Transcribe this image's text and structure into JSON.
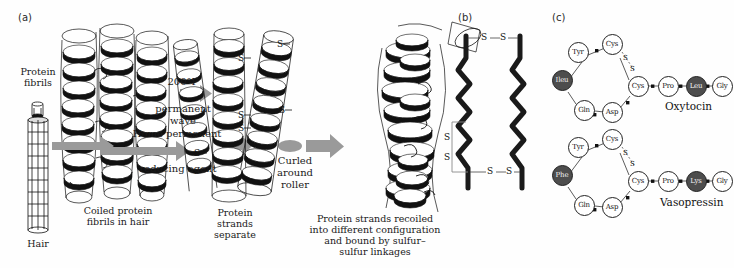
{
  "figure": {
    "background_color": "#fefefe",
    "ink_color": "#111111",
    "arrow_color": "#8c8c8c",
    "highlight_residue_color": "#4d4d4d"
  },
  "panels": {
    "a": {
      "label": "(a)",
      "labels": {
        "protein_fibrils": "Protein\nfibrils",
        "hair": "Hair"
      },
      "captions": {
        "coiled": "Coiled protein\nfibrils in hair",
        "separate": "Protein\nstrands\nseparate",
        "recoiled": "Protein strands recoiled\ninto different configuration\nand bound by sulfur–\nsulfur linkages"
      },
      "arrows": [
        {
          "name": "permanent-wave-arrow",
          "above": "200°F",
          "below": "permanent\nwave"
        },
        {
          "name": "home-permanent-arrow",
          "above": "Home permanent",
          "below": "reducing agent"
        },
        {
          "name": "curled-roller-arrow",
          "above": "",
          "below": "Curled\naround\nroller"
        }
      ],
      "sulfur_labels": [
        "S",
        "S",
        "S",
        "S",
        "S",
        "S"
      ]
    },
    "b": {
      "label": "(b)",
      "links": {
        "top": [
          "S",
          "S"
        ],
        "bottom": [
          "S",
          "S"
        ],
        "bracket": [
          "S",
          "S"
        ]
      }
    },
    "c": {
      "label": "(c)",
      "peptides": [
        {
          "name": "Oxytocin",
          "ring": [
            "Cys",
            "Tyr",
            "Ileu",
            "Gln",
            "Asp",
            "Cys"
          ],
          "ring_filled": [
            false,
            false,
            true,
            false,
            false,
            false
          ],
          "tail": [
            "Pro",
            "Leu",
            "Gly"
          ],
          "tail_filled": [
            false,
            true,
            false
          ],
          "disulfide": [
            "S",
            "S"
          ]
        },
        {
          "name": "Vasopressin",
          "ring": [
            "Cys",
            "Tyr",
            "Phe",
            "Gln",
            "Asp",
            "Cys"
          ],
          "ring_filled": [
            false,
            false,
            true,
            false,
            false,
            false
          ],
          "tail": [
            "Pro",
            "Lys",
            "Gly"
          ],
          "tail_filled": [
            false,
            true,
            false
          ],
          "disulfide": [
            "S",
            "S"
          ]
        }
      ]
    }
  }
}
